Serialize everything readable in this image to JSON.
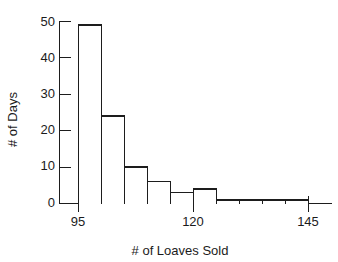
{
  "chart_data": {
    "type": "bar",
    "title": "",
    "subtitle": "",
    "xlabel": "# of Loaves Sold",
    "ylabel": "# of Days",
    "grid": false,
    "legend": null,
    "xlim": [
      93,
      148
    ],
    "ylim": [
      0,
      50
    ],
    "bin_width": 5,
    "x_tick_labels": [
      "95",
      "120",
      "145"
    ],
    "x_tick_values": [
      95,
      120,
      145
    ],
    "x_minor_tick_values": [],
    "y_tick_labels": [
      "0",
      "10",
      "20",
      "30",
      "40",
      "50"
    ],
    "y_tick_values": [
      0,
      10,
      20,
      30,
      40,
      50
    ],
    "y_minor_tick_values": [
      5,
      15,
      25,
      35,
      45
    ],
    "bin_edges": [
      95,
      100,
      105,
      110,
      115,
      120,
      125,
      130,
      135,
      140,
      145
    ],
    "categories": [
      "95-100",
      "100-105",
      "105-110",
      "110-115",
      "115-120",
      "120-125",
      "125-130",
      "130-135",
      "135-140",
      "140-145"
    ],
    "values": [
      49,
      24,
      10,
      6,
      3,
      4,
      1,
      1,
      1,
      1
    ],
    "annotations": []
  },
  "axes": {
    "y_label": "# of Days",
    "x_label": "# of Loaves Sold"
  },
  "ticks": {
    "y": [
      "50",
      "40",
      "30",
      "20",
      "10",
      "0"
    ],
    "x": [
      "95",
      "120",
      "145"
    ]
  },
  "style": {
    "line_color": "#1d1d1d",
    "bar_fill": "#ffffff",
    "text_color": "#1b1b1b",
    "background": "#ffffff"
  }
}
